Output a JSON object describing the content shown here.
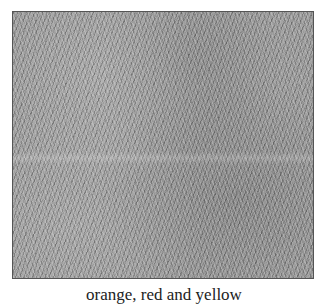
{
  "figure": {
    "image": {
      "description": "grayscale grass texture",
      "border_color": "#555555",
      "base_color": "#9a9a9a"
    },
    "caption": "orange, red and yellow"
  }
}
